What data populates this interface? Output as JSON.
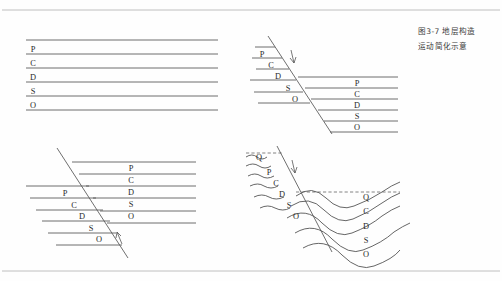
{
  "page": {
    "background_color": "#fefefe",
    "ink_color": "#4a4a4a",
    "label_color": "#2a2a2a",
    "rule_color": "#b9b9b9",
    "width": 502,
    "height": 281,
    "top_rule_y": 10,
    "bottom_rule_y": 271
  },
  "caption": {
    "line1": "图3-7  地层构造",
    "line2": "运动简化示意",
    "color": "#3b3b3b"
  },
  "legend": {
    "stratum_codes": [
      "Q",
      "P",
      "C",
      "D",
      "S",
      "O"
    ],
    "code_meanings": {
      "Q": "Q",
      "P": "P",
      "C": "C",
      "D": "D",
      "S": "S",
      "O": "O"
    }
  },
  "panels": [
    {
      "id": "panel-top-left",
      "name": "undeformed-horizontal-strata",
      "position": {
        "x": 22,
        "y": 36,
        "width": 196,
        "height": 96
      },
      "structure_type": "horizontal",
      "bed_lines_y": [
        40,
        54,
        68,
        82,
        96,
        110
      ],
      "bed_line_x": [
        26,
        218
      ],
      "labels": [
        {
          "text": "P",
          "x": 33,
          "y": 52
        },
        {
          "text": "C",
          "x": 33,
          "y": 66
        },
        {
          "text": "D",
          "x": 33,
          "y": 80
        },
        {
          "text": "S",
          "x": 33,
          "y": 94
        },
        {
          "text": "O",
          "x": 33,
          "y": 108
        }
      ]
    },
    {
      "id": "panel-top-right",
      "name": "normal-fault-right-block-down",
      "position": {
        "x": 248,
        "y": 34,
        "width": 150,
        "height": 106
      },
      "structure_type": "fault",
      "fault": {
        "x1": 268,
        "y1": 36,
        "x2": 330,
        "y2": 132,
        "arrow_direction": "down",
        "arrow_x": 292,
        "arrow_y": 56
      },
      "left_block_labels": [
        {
          "text": "P",
          "x": 262,
          "y": 57
        },
        {
          "text": "C",
          "x": 271,
          "y": 68
        },
        {
          "text": "D",
          "x": 277,
          "y": 79
        },
        {
          "text": "S",
          "x": 288,
          "y": 91
        },
        {
          "text": "O",
          "x": 295,
          "y": 102
        }
      ],
      "right_block_labels": [
        {
          "text": "P",
          "x": 357,
          "y": 86
        },
        {
          "text": "C",
          "x": 357,
          "y": 97
        },
        {
          "text": "D",
          "x": 357,
          "y": 108
        },
        {
          "text": "S",
          "x": 357,
          "y": 119
        },
        {
          "text": "O",
          "x": 357,
          "y": 130
        }
      ]
    },
    {
      "id": "panel-bottom-left",
      "name": "fault-left-block-down",
      "position": {
        "x": 26,
        "y": 148,
        "width": 180,
        "height": 110
      },
      "structure_type": "fault",
      "fault": {
        "x1": 58,
        "y1": 150,
        "x2": 126,
        "y2": 256,
        "arrow_direction": "up",
        "arrow_x": 119,
        "arrow_y": 238
      },
      "left_block_labels": [
        {
          "text": "P",
          "x": 65,
          "y": 196
        },
        {
          "text": "C",
          "x": 74,
          "y": 208
        },
        {
          "text": "D",
          "x": 82,
          "y": 219
        },
        {
          "text": "S",
          "x": 91,
          "y": 231
        },
        {
          "text": "O",
          "x": 99,
          "y": 242
        }
      ],
      "right_block_labels": [
        {
          "text": "P",
          "x": 131,
          "y": 170
        },
        {
          "text": "C",
          "x": 131,
          "y": 182
        },
        {
          "text": "D",
          "x": 131,
          "y": 194
        },
        {
          "text": "S",
          "x": 131,
          "y": 207
        },
        {
          "text": "O",
          "x": 131,
          "y": 219
        }
      ]
    },
    {
      "id": "panel-bottom-right",
      "name": "folded-strata-with-erosion-surface",
      "position": {
        "x": 246,
        "y": 146,
        "width": 152,
        "height": 112
      },
      "structure_type": "fold",
      "fold_style": "syncline",
      "erosion_surface": {
        "left_segment": {
          "x1": 246,
          "y1": 153,
          "x2": 282,
          "y2": 153
        },
        "right_segment": {
          "x1": 296,
          "y1": 192,
          "x2": 400,
          "y2": 192
        },
        "style": "dashed"
      },
      "fault": {
        "x1": 278,
        "y1": 148,
        "x2": 330,
        "y2": 250,
        "arrow_direction": "down",
        "arrow_x": 293,
        "arrow_y": 166
      },
      "left_block_labels": [
        {
          "text": "Q",
          "x": 258,
          "y": 159
        },
        {
          "text": "P",
          "x": 268,
          "y": 174
        },
        {
          "text": "C",
          "x": 275,
          "y": 185
        },
        {
          "text": "D",
          "x": 281,
          "y": 196
        },
        {
          "text": "S",
          "x": 288,
          "y": 207
        },
        {
          "text": "O",
          "x": 294,
          "y": 218
        }
      ],
      "right_block_labels": [
        {
          "text": "Q",
          "x": 366,
          "y": 200
        },
        {
          "text": "C",
          "x": 366,
          "y": 214
        },
        {
          "text": "D",
          "x": 366,
          "y": 229
        },
        {
          "text": "S",
          "x": 366,
          "y": 243
        },
        {
          "text": "O",
          "x": 366,
          "y": 257
        }
      ]
    }
  ]
}
